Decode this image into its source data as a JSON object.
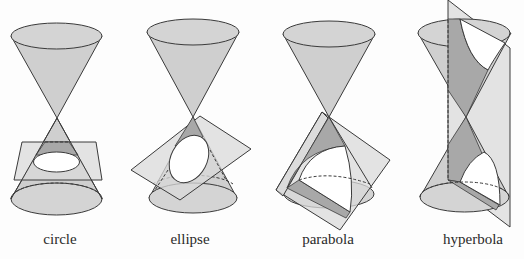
{
  "figure": {
    "panels": [
      {
        "id": "circle",
        "label": "circle"
      },
      {
        "id": "ellipse",
        "label": "ellipse"
      },
      {
        "id": "parabola",
        "label": "parabola"
      },
      {
        "id": "hyperbola",
        "label": "hyperbola"
      }
    ]
  },
  "colors": {
    "background": "#fdfdfd",
    "cone_fill": "#cfcfcf",
    "plane_fill": "#d9d9d9",
    "section_shadow": "#a8a8a8",
    "outline": "#3a3a3a"
  }
}
